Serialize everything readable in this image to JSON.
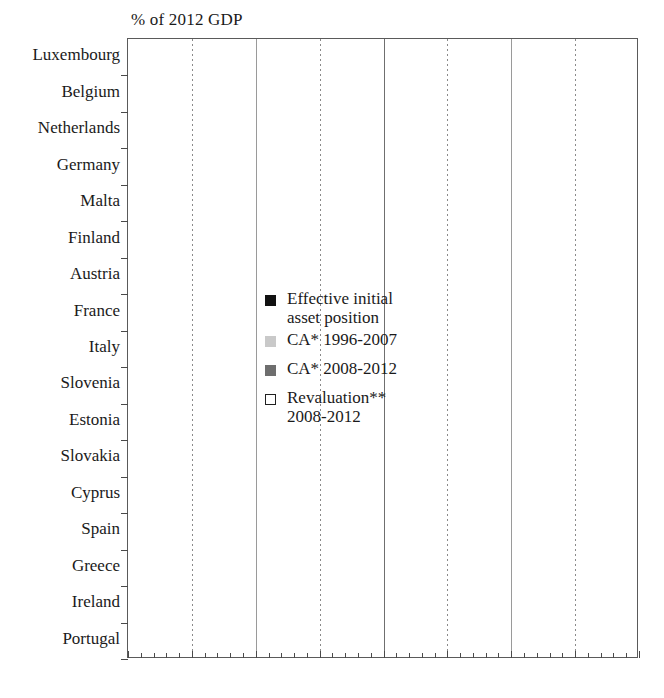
{
  "chart": {
    "type": "bar",
    "title": "% of 2012 GDP",
    "axis_title": "% of 2012 GDP",
    "xlabel": "",
    "ylabel": "",
    "xlim": [
      -200,
      200
    ],
    "xticks": [
      "– 200",
      "– 150",
      "– 100",
      "– 50",
      "0",
      "50",
      "100",
      "150",
      "200"
    ],
    "xtick_values": [
      -200,
      -150,
      -100,
      -50,
      0,
      50,
      100,
      150,
      200
    ],
    "grid": "vertical dotted at -150, -50, 50, 150; solid at 0 and -100, 100",
    "legend_position": "inside-left",
    "orientation": "horizontal"
  },
  "legend": [
    {
      "key": "init",
      "label": "Effective initial asset position",
      "color": "#111111",
      "swatch": "init"
    },
    {
      "key": "ca1",
      "label": "CA* 1996-2007",
      "color": "#c9c9c9",
      "swatch": "ca1"
    },
    {
      "key": "ca2",
      "label": "CA* 2008-2012",
      "color": "#6e6e6e",
      "swatch": "ca2"
    },
    {
      "key": "reval",
      "label": "Revaluation** 2008-2012",
      "color": "#ffffff",
      "swatch": "reval"
    }
  ],
  "legend_lines": {
    "init_l1": "Effective initial",
    "init_l2": "asset position",
    "ca1": "CA* 1996-2007",
    "ca2": "CA* 2008-2012",
    "reval_l1": "Revaluation**",
    "reval_l2": "2008-2012"
  },
  "chart_data": {
    "type": "bar",
    "title": "% of 2012 GDP",
    "xlabel": "% of 2012 GDP",
    "ylabel": "",
    "xlim": [
      -200,
      200
    ],
    "categories": [
      "Luxembourg",
      "Belgium",
      "Netherlands",
      "Germany",
      "Malta",
      "Finland",
      "Austria",
      "France",
      "Italy",
      "Slovenia",
      "Estonia",
      "Slovakia",
      "Cyprus",
      "Spain",
      "Greece",
      "Ireland",
      "Portugal"
    ],
    "series": [
      {
        "name": "Effective initial asset position",
        "color": "#111111",
        "values": [
          12,
          4,
          -46,
          5,
          14,
          -69,
          -9,
          2,
          9,
          -3,
          1,
          1,
          40,
          31,
          34,
          3,
          2
        ]
      },
      {
        "name": "CA* 1996-2007",
        "color": "#c9c9c9",
        "values": [
          98,
          25,
          44,
          24,
          47,
          53,
          -11,
          -11,
          -12,
          -17,
          -50,
          -51,
          -53,
          -62,
          -69,
          -12,
          -65
        ]
      },
      {
        "name": "CA* 2008-2012",
        "color": "#6e6e6e",
        "values": [
          28,
          0,
          18,
          16,
          0,
          0,
          -5,
          -6,
          -5,
          -9,
          -1,
          -8,
          -22,
          -19,
          -17,
          2,
          -25
        ]
      },
      {
        "name": "Revaluation** 2008-2012",
        "color": "#ffffff",
        "values": [
          31,
          19,
          31,
          20,
          21,
          34,
          -3,
          -6,
          -20,
          -16,
          -4,
          -6,
          -47,
          -41,
          -57,
          -105,
          -27
        ]
      }
    ],
    "endpoint_labels": [
      {
        "category": "Luxembourg",
        "value": 169,
        "text": "169"
      },
      {
        "category": "Belgium",
        "value": 48,
        "text": "48"
      },
      {
        "category": "Netherlands",
        "value": 47,
        "text": "47"
      },
      {
        "category": "Germany",
        "value": 42,
        "text": "42"
      },
      {
        "category": "Malta",
        "value": 25,
        "text": "25"
      },
      {
        "category": "Finland",
        "value": 18,
        "text": "18"
      },
      {
        "category": "Austria",
        "value": 0,
        "text": "0"
      },
      {
        "category": "France",
        "value": -21,
        "text": "– 21"
      },
      {
        "category": "Italy",
        "value": -28,
        "text": "– 28"
      },
      {
        "category": "Slovenia",
        "value": -45,
        "text": "– 45"
      },
      {
        "category": "Estonia",
        "value": -54,
        "text": "– 54"
      },
      {
        "category": "Slovakia",
        "value": -64,
        "text": "– 64"
      },
      {
        "category": "Cyprus",
        "value": -82,
        "text": "– 82"
      },
      {
        "category": "Spain",
        "value": -91,
        "text": "– 91"
      },
      {
        "category": "Greece",
        "value": -109,
        "text": "– 109"
      },
      {
        "category": "Ireland",
        "value": -112,
        "text": "– 112"
      },
      {
        "category": "Portugal",
        "value": -115,
        "text": "– 115"
      }
    ]
  },
  "colors": {
    "init": "#111111",
    "ca1": "#c9c9c9",
    "ca2": "#6e6e6e",
    "reval": "#ffffff",
    "axis": "#5a5a5a",
    "grid": "#8a8a8a",
    "text": "#1a1a1a"
  }
}
